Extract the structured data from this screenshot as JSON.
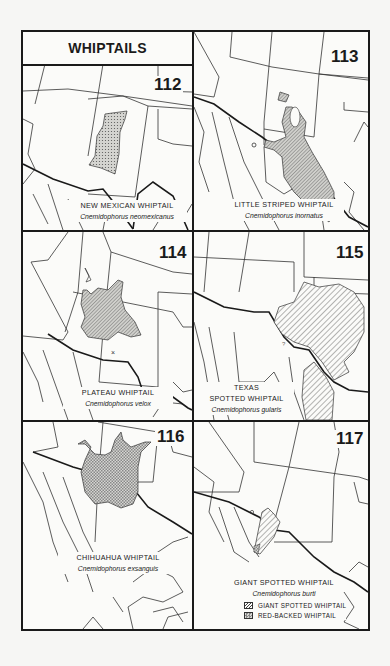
{
  "plate": {
    "title": "WHIPTAILS",
    "colors": {
      "ink": "#1a1a1a",
      "range_fill": "#c9c9c6",
      "paper": "#fbfbf9"
    }
  },
  "maps": [
    {
      "number": "112",
      "common_name": "NEW MEXICAN WHIPTAIL",
      "scientific_name": "Cnemidophorus neomexicanus",
      "range_pattern": "stipple"
    },
    {
      "number": "113",
      "common_name": "LITTLE STRIPED WHIPTAIL",
      "scientific_name": "Cnemidophorus inornatus",
      "range_pattern": "fine-hatch",
      "annotation": "?"
    },
    {
      "number": "114",
      "common_name": "PLATEAU WHIPTAIL",
      "scientific_name": "Cnemidophorus velox",
      "range_pattern": "fine-hatch",
      "annotation": "×"
    },
    {
      "number": "115",
      "common_name_line1": "TEXAS",
      "common_name_line2": "SPOTTED WHIPTAIL",
      "scientific_name": "Cnemidophorus gularis",
      "range_pattern": "diagonal-hatch",
      "annotation": "?"
    },
    {
      "number": "116",
      "common_name": "CHIHUAHUA WHIPTAIL",
      "scientific_name": "Cnemidophorus exsanguis",
      "range_pattern": "crosshatch"
    },
    {
      "number": "117",
      "common_name": "GIANT SPOTTED WHIPTAIL",
      "scientific_name": "Cnemidophorus burti",
      "range_pattern": "diagonal-hatch",
      "legend": [
        {
          "label": "GIANT SPOTTED WHIPTAIL",
          "pattern": "diagonal-hatch"
        },
        {
          "label": "RED-BACKED WHIPTAIL",
          "pattern": "crosshatch"
        }
      ]
    }
  ]
}
